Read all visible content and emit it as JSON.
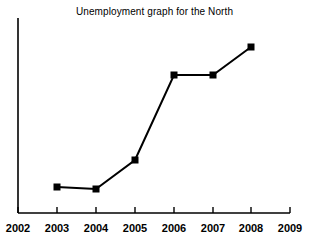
{
  "chart_data": {
    "type": "line",
    "title": "Unemployment graph for the North",
    "xlabel": "",
    "ylabel": "",
    "x": [
      2003,
      2004,
      2005,
      2006,
      2007,
      2008
    ],
    "values": [
      14,
      13,
      31,
      84,
      84,
      102
    ],
    "categories": [
      "2003",
      "2004",
      "2005",
      "2006",
      "2007",
      "2008"
    ],
    "series": [
      {
        "name": "Unemployment",
        "values": [
          14,
          13,
          31,
          84,
          84,
          102
        ]
      }
    ],
    "xticks": [
      "2002",
      "2003",
      "2004",
      "2005",
      "2006",
      "2007",
      "2008",
      "2009"
    ],
    "xlim": [
      2002,
      2009
    ],
    "ylim": [
      0,
      130
    ],
    "yticks": [],
    "grid": false,
    "legend": false,
    "legend_position": "none",
    "marker": "square",
    "line_color": "#000000",
    "marker_color": "#000000",
    "background_color": "#ffffff",
    "axis_color": "#000000",
    "y_axis_labeled": false
  },
  "axes": {
    "x_axis_name": "year-axis",
    "y_axis_name": "unemployment-axis",
    "ticks": [
      {
        "label": "2002",
        "x": 18
      },
      {
        "label": "2003",
        "x": 57
      },
      {
        "label": "2004",
        "x": 96
      },
      {
        "label": "2005",
        "x": 135
      },
      {
        "label": "2006",
        "x": 174
      },
      {
        "label": "2007",
        "x": 213
      },
      {
        "label": "2008",
        "x": 251
      },
      {
        "label": "2009",
        "x": 290
      }
    ]
  },
  "points": [
    {
      "label": "2003",
      "cx": 57,
      "cy": 187
    },
    {
      "label": "2004",
      "cx": 96,
      "cy": 189
    },
    {
      "label": "2005",
      "cx": 135,
      "cy": 160
    },
    {
      "label": "2006",
      "cx": 174,
      "cy": 75
    },
    {
      "label": "2007",
      "cx": 213,
      "cy": 75
    },
    {
      "label": "2008",
      "cx": 251,
      "cy": 47
    }
  ],
  "geometry": {
    "y_axis_x": 18,
    "y_axis_top": 18,
    "x_axis_y": 213,
    "x_axis_left": 18,
    "x_axis_right": 290,
    "tick_length": 6,
    "polyline": "57,187 96,189 135,160 174,75 213,75 251,47"
  }
}
